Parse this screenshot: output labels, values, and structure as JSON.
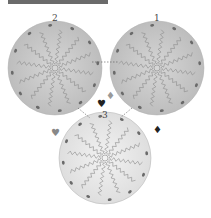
{
  "header": {
    "bar_color": "#6b6b6b"
  },
  "discs": [
    {
      "id": "disc-2",
      "label": "2",
      "cx": 55,
      "cy": 68,
      "r": 47
    },
    {
      "id": "disc-1",
      "label": "1",
      "cx": 157,
      "cy": 68,
      "r": 47
    },
    {
      "id": "disc-3",
      "label": "3",
      "cx": 105,
      "cy": 158,
      "r": 46
    }
  ],
  "markers": [
    {
      "suit": "heart",
      "glyph": "♥",
      "x": 101,
      "y": 104,
      "color": "#222222"
    },
    {
      "suit": "heart",
      "glyph": "♥",
      "x": 55,
      "y": 133,
      "color": "#888888"
    },
    {
      "suit": "diamond",
      "glyph": "♦",
      "x": 110,
      "y": 96,
      "color": "#999999"
    },
    {
      "suit": "diamond",
      "glyph": "♦",
      "x": 157,
      "y": 130,
      "color": "#222222"
    }
  ],
  "colors": {
    "disc_fill": "#c9c9c9",
    "disc_fill_3": "#e4e4e4",
    "spoke": "#8a8a8a",
    "rim_dot": "#6a6a6a"
  }
}
